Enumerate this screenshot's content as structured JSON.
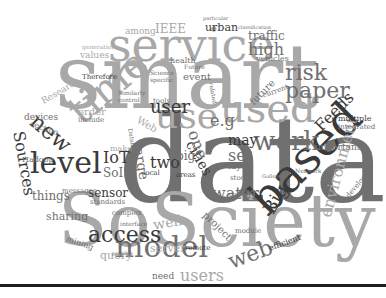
{
  "figure": {
    "type": "word cloud",
    "words": [
      {
        "text": "data",
        "x": 118,
        "y": 100,
        "size": 120,
        "tone": "mid",
        "rot": 0
      },
      {
        "text": "smart",
        "x": 55,
        "y": 32,
        "size": 90,
        "tone": "light",
        "rot": 0
      },
      {
        "text": "SoSciety",
        "x": 58,
        "y": 185,
        "size": 72,
        "tone": "light",
        "rot": 0
      },
      {
        "text": "service",
        "x": 108,
        "y": 22,
        "size": 46,
        "tone": "light",
        "rot": 0
      },
      {
        "text": "time",
        "x": 60,
        "y": 100,
        "size": 40,
        "tone": "light",
        "rot": -40
      },
      {
        "text": "used",
        "x": 220,
        "y": 88,
        "size": 40,
        "tone": "light",
        "rot": 0
      },
      {
        "text": "use",
        "x": 155,
        "y": 98,
        "size": 36,
        "tone": "light",
        "rot": 0
      },
      {
        "text": "based",
        "x": 240,
        "y": 190,
        "size": 46,
        "tone": "dark",
        "rot": -45
      },
      {
        "text": "model",
        "x": 115,
        "y": 232,
        "size": 30,
        "tone": "mid",
        "rot": 0
      },
      {
        "text": "level",
        "x": 30,
        "y": 148,
        "size": 30,
        "tone": "dark",
        "rot": 0
      },
      {
        "text": "work",
        "x": 253,
        "y": 128,
        "size": 26,
        "tone": "mid",
        "rot": 0
      },
      {
        "text": "paper",
        "x": 285,
        "y": 80,
        "size": 22,
        "tone": "mid",
        "rot": 0
      },
      {
        "text": "risk",
        "x": 285,
        "y": 62,
        "size": 22,
        "tone": "mid",
        "rot": 0
      },
      {
        "text": "access",
        "x": 88,
        "y": 224,
        "size": 22,
        "tone": "dark",
        "rot": 0
      },
      {
        "text": "new",
        "x": 40,
        "y": 110,
        "size": 22,
        "tone": "dark",
        "rot": 40
      },
      {
        "text": "Sources",
        "x": 26,
        "y": 130,
        "size": 16,
        "tone": "dark",
        "rot": 80
      },
      {
        "text": "user",
        "x": 150,
        "y": 98,
        "size": 18,
        "tone": "dark",
        "rot": 0
      },
      {
        "text": "Big",
        "x": 260,
        "y": 208,
        "size": 18,
        "tone": "dark",
        "rot": -60
      },
      {
        "text": "web",
        "x": 225,
        "y": 252,
        "size": 22,
        "tone": "mid",
        "rot": -20
      },
      {
        "text": "environment",
        "x": 318,
        "y": 215,
        "size": 16,
        "tone": "light",
        "rot": -75
      },
      {
        "text": "Feeds",
        "x": 312,
        "y": 123,
        "size": 16,
        "tone": "dark",
        "rot": -45
      },
      {
        "text": "two",
        "x": 150,
        "y": 155,
        "size": 16,
        "tone": "dark",
        "rot": 0
      },
      {
        "text": "water",
        "x": 212,
        "y": 186,
        "size": 16,
        "tone": "mid",
        "rot": 0
      },
      {
        "text": "set",
        "x": 228,
        "y": 148,
        "size": 16,
        "tone": "mid",
        "rot": 0
      },
      {
        "text": "cities",
        "x": 196,
        "y": 138,
        "size": 14,
        "tone": "dark",
        "rot": 60
      },
      {
        "text": "one",
        "x": 200,
        "y": 128,
        "size": 16,
        "tone": "mid",
        "rot": 70
      },
      {
        "text": "may",
        "x": 228,
        "y": 133,
        "size": 14,
        "tone": "dark",
        "rot": 0
      },
      {
        "text": "large",
        "x": 145,
        "y": 142,
        "size": 14,
        "tone": "mid",
        "rot": 80
      },
      {
        "text": "big",
        "x": 176,
        "y": 150,
        "size": 12,
        "tone": "mid",
        "rot": 0
      },
      {
        "text": "e.g",
        "x": 210,
        "y": 113,
        "size": 16,
        "tone": "mid",
        "rot": 0
      },
      {
        "text": "high",
        "x": 248,
        "y": 42,
        "size": 16,
        "tone": "mid",
        "rot": 0
      },
      {
        "text": "traffic",
        "x": 248,
        "y": 30,
        "size": 12,
        "tone": "mid",
        "rot": 0
      },
      {
        "text": "urban",
        "x": 205,
        "y": 22,
        "size": 11,
        "tone": "dark",
        "rot": 0
      },
      {
        "text": "IEEE",
        "x": 155,
        "y": 23,
        "size": 12,
        "tone": "light",
        "rot": 0
      },
      {
        "text": "among",
        "x": 125,
        "y": 27,
        "size": 9,
        "tone": "light",
        "rot": 0
      },
      {
        "text": "IoT",
        "x": 103,
        "y": 150,
        "size": 16,
        "tone": "dark",
        "rot": 0
      },
      {
        "text": "SoIS",
        "x": 103,
        "y": 167,
        "size": 12,
        "tone": "mid",
        "rot": 0
      },
      {
        "text": "sensor",
        "x": 88,
        "y": 187,
        "size": 12,
        "tone": "dark",
        "rot": 0
      },
      {
        "text": "things",
        "x": 32,
        "y": 190,
        "size": 12,
        "tone": "mid",
        "rot": 0
      },
      {
        "text": "sharing",
        "x": 46,
        "y": 211,
        "size": 11,
        "tone": "mid",
        "rot": 0
      },
      {
        "text": "mining",
        "x": 68,
        "y": 235,
        "size": 8,
        "tone": "mid",
        "rot": 20
      },
      {
        "text": "query",
        "x": 100,
        "y": 250,
        "size": 11,
        "tone": "light",
        "rot": 0
      },
      {
        "text": "server",
        "x": 150,
        "y": 243,
        "size": 11,
        "tone": "light",
        "rot": 0
      },
      {
        "text": "need",
        "x": 152,
        "y": 272,
        "size": 9,
        "tone": "mid",
        "rot": 0
      },
      {
        "text": "users",
        "x": 180,
        "y": 268,
        "size": 16,
        "tone": "light",
        "rot": 0
      },
      {
        "text": "well",
        "x": 152,
        "y": 218,
        "size": 14,
        "tone": "light",
        "rot": -10
      },
      {
        "text": "project",
        "x": 208,
        "y": 210,
        "size": 10,
        "tone": "mid",
        "rot": 45
      },
      {
        "text": "future",
        "x": 248,
        "y": 100,
        "size": 10,
        "tone": "mid",
        "rot": -45
      },
      {
        "text": "Web",
        "x": 140,
        "y": 115,
        "size": 10,
        "tone": "light",
        "rot": 30
      },
      {
        "text": "devices",
        "x": 24,
        "y": 113,
        "size": 9,
        "tone": "mid",
        "rot": 0
      },
      {
        "text": "section",
        "x": 32,
        "y": 120,
        "size": 8,
        "tone": "mid",
        "rot": 20
      },
      {
        "text": "order",
        "x": 78,
        "y": 107,
        "size": 10,
        "tone": "light",
        "rot": 0
      },
      {
        "text": "include",
        "x": 78,
        "y": 117,
        "size": 7,
        "tone": "mid",
        "rot": 0
      },
      {
        "text": "Research",
        "x": 40,
        "y": 98,
        "size": 9,
        "tone": "light",
        "rot": -30
      },
      {
        "text": "values",
        "x": 80,
        "y": 51,
        "size": 9,
        "tone": "light",
        "rot": 0
      },
      {
        "text": "generation",
        "x": 82,
        "y": 44,
        "size": 6,
        "tone": "light",
        "rot": 0
      },
      {
        "text": "Therefore",
        "x": 82,
        "y": 74,
        "size": 7,
        "tone": "dark",
        "rot": 0
      },
      {
        "text": "health",
        "x": 170,
        "y": 57,
        "size": 8,
        "tone": "mid",
        "rot": 0
      },
      {
        "text": "event",
        "x": 183,
        "y": 72,
        "size": 10,
        "tone": "mid",
        "rot": 0
      },
      {
        "text": "vehicles",
        "x": 256,
        "y": 55,
        "size": 8,
        "tone": "mid",
        "rot": 0
      },
      {
        "text": "current",
        "x": 262,
        "y": 93,
        "size": 7,
        "tone": "mid",
        "rot": -20
      },
      {
        "text": "multiple",
        "x": 338,
        "y": 115,
        "size": 8,
        "tone": "dark",
        "rot": 0
      },
      {
        "text": "integrated",
        "x": 338,
        "y": 124,
        "size": 7,
        "tone": "mid",
        "rot": 0
      },
      {
        "text": "important",
        "x": 315,
        "y": 143,
        "size": 9,
        "tone": "mid",
        "rot": 0
      },
      {
        "text": "Hadoop",
        "x": 22,
        "y": 156,
        "size": 8,
        "tone": "mid",
        "rot": 0
      },
      {
        "text": "messages",
        "x": 62,
        "y": 188,
        "size": 7,
        "tone": "mid",
        "rot": 0
      },
      {
        "text": "standards",
        "x": 90,
        "y": 199,
        "size": 7,
        "tone": "mid",
        "rot": 0
      },
      {
        "text": "make",
        "x": 110,
        "y": 145,
        "size": 8,
        "tone": "light",
        "rot": 0
      },
      {
        "text": "local",
        "x": 143,
        "y": 170,
        "size": 7,
        "tone": "dark",
        "rot": 0
      },
      {
        "text": "areas",
        "x": 176,
        "y": 172,
        "size": 7,
        "tone": "dark",
        "rot": 0
      },
      {
        "text": "layer",
        "x": 228,
        "y": 162,
        "size": 9,
        "tone": "mid",
        "rot": 0
      },
      {
        "text": "stock",
        "x": 230,
        "y": 175,
        "size": 7,
        "tone": "mid",
        "rot": 0
      },
      {
        "text": "module",
        "x": 235,
        "y": 228,
        "size": 7,
        "tone": "mid",
        "rot": 0
      },
      {
        "text": "efficient",
        "x": 268,
        "y": 245,
        "size": 8,
        "tone": "dark",
        "rot": -20
      },
      {
        "text": "developed",
        "x": 345,
        "y": 195,
        "size": 7,
        "tone": "mid",
        "rot": -50
      },
      {
        "text": "remote",
        "x": 185,
        "y": 245,
        "size": 7,
        "tone": "dark",
        "rot": 0
      },
      {
        "text": "complex",
        "x": 112,
        "y": 210,
        "size": 7,
        "tone": "mid",
        "rot": 0
      },
      {
        "text": "interface",
        "x": 120,
        "y": 221,
        "size": 6,
        "tone": "mid",
        "rot": 0
      },
      {
        "text": "Volume",
        "x": 228,
        "y": 193,
        "size": 7,
        "tone": "mid",
        "rot": -10
      },
      {
        "text": "Network",
        "x": 295,
        "y": 168,
        "size": 6,
        "tone": "mid",
        "rot": 0
      },
      {
        "text": "Science",
        "x": 150,
        "y": 70,
        "size": 6,
        "tone": "mid",
        "rot": 0
      },
      {
        "text": "specific",
        "x": 150,
        "y": 77,
        "size": 6,
        "tone": "mid",
        "rot": 0
      },
      {
        "text": "tools",
        "x": 153,
        "y": 98,
        "size": 7,
        "tone": "mid",
        "rot": 0
      },
      {
        "text": "Similarly",
        "x": 118,
        "y": 90,
        "size": 6,
        "tone": "mid",
        "rot": 0
      },
      {
        "text": "control",
        "x": 118,
        "y": 97,
        "size": 6,
        "tone": "mid",
        "rot": 0
      },
      {
        "text": "Database",
        "x": 133,
        "y": 128,
        "size": 6,
        "tone": "mid",
        "rot": 80
      },
      {
        "text": "Future",
        "x": 184,
        "y": 64,
        "size": 6,
        "tone": "mid",
        "rot": 0
      },
      {
        "text": "related",
        "x": 214,
        "y": 82,
        "size": 6,
        "tone": "mid",
        "rot": 80
      },
      {
        "text": "possible",
        "x": 112,
        "y": 251,
        "size": 5,
        "tone": "mid",
        "rot": 0
      },
      {
        "text": "particular",
        "x": 203,
        "y": 16,
        "size": 5,
        "tone": "mid",
        "rot": 0
      },
      {
        "text": "classification",
        "x": 238,
        "y": 25,
        "size": 5,
        "tone": "mid",
        "rot": 0
      },
      {
        "text": "Gollsword",
        "x": 262,
        "y": 174,
        "size": 5,
        "tone": "mid",
        "rot": 0
      }
    ]
  }
}
